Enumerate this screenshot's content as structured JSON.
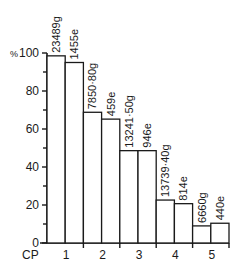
{
  "chart_data": {
    "type": "bar",
    "title": "",
    "xlabel": "CP",
    "ylabel": "%",
    "ylim": [
      0,
      100
    ],
    "yticks_major": [
      0,
      20,
      40,
      60,
      80,
      100
    ],
    "yticks_minor": [
      10,
      30,
      50,
      70,
      90
    ],
    "categories": [
      "1",
      "2",
      "3",
      "4",
      "5"
    ],
    "series": [
      {
        "name": "g",
        "values": [
          98.5,
          68.8,
          48.6,
          22.6,
          9.0
        ],
        "labels": [
          "23489g",
          "7850·80g",
          "13241·50g",
          "13739·40g",
          "6660g"
        ]
      },
      {
        "name": "e",
        "values": [
          95.0,
          65.2,
          48.6,
          20.7,
          10.4
        ],
        "labels": [
          "1455e",
          "459e",
          "946e",
          "814e",
          "440e"
        ]
      }
    ],
    "grid": false,
    "legend": "none"
  },
  "axis": {
    "y_unit": "%",
    "x_prefix": "CP",
    "y_tick_labels": [
      "0",
      "20",
      "40",
      "60",
      "80",
      "100"
    ],
    "x_tick_labels": [
      "1",
      "2",
      "3",
      "4",
      "5"
    ]
  },
  "colors": {
    "ink": "#1a1a1a",
    "bar_fill": "#ffffff",
    "background": "#ffffff"
  }
}
